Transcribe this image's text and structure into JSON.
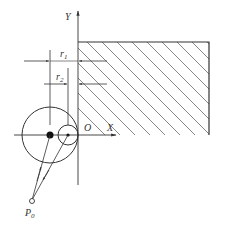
{
  "diagram": {
    "axes": {
      "x_label": "X",
      "y_label": "Y",
      "origin_label": "O"
    },
    "dimensions": {
      "r1_label": "r",
      "r1_sub": "1",
      "r2_label": "r",
      "r2_sub": "2"
    },
    "point": {
      "label": "P",
      "sub": "0"
    },
    "colors": {
      "line": "#333333",
      "hatch": "#555555",
      "background": "#ffffff"
    }
  }
}
